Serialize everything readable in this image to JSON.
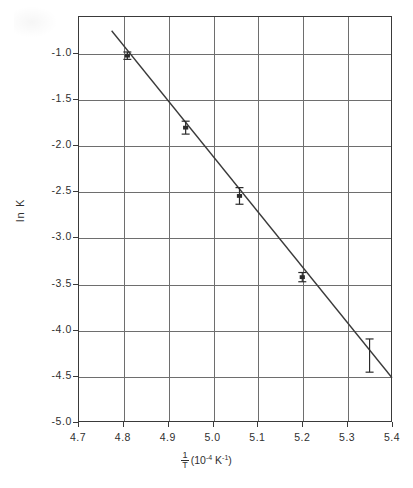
{
  "chart_data": {
    "type": "scatter",
    "title": "",
    "subtitle": "",
    "xlabel_parts": {
      "numerator": "1",
      "denominator": "T",
      "units": "(10",
      "units_exp": "-4",
      "units_mid": " K",
      "units_exp2": "-1",
      "units_close": ")"
    },
    "xlabel": "1/T (10^-4 K^-1)",
    "ylabel": "ln K",
    "xlim": [
      4.7,
      5.4
    ],
    "ylim": [
      -5.0,
      -0.6
    ],
    "grid": true,
    "legend": "none",
    "x_ticks": [
      "4.7",
      "4.8",
      "4.9",
      "5.0",
      "5.1",
      "5.2",
      "5.3",
      "5.4"
    ],
    "x_tick_values": [
      4.7,
      4.8,
      4.9,
      5.0,
      5.1,
      5.2,
      5.3,
      5.4
    ],
    "y_ticks": [
      "-1.0",
      "-1.5",
      "-2.0",
      "-2.5",
      "-3.0",
      "-3.5",
      "-4.0",
      "-4.5",
      "-5.0"
    ],
    "y_tick_values": [
      -1.0,
      -1.5,
      -2.0,
      -2.5,
      -3.0,
      -3.5,
      -4.0,
      -4.5,
      -5.0
    ],
    "x": [
      4.81,
      4.94,
      5.06,
      5.2,
      5.35
    ],
    "values": [
      -1.03,
      -1.81,
      -2.55,
      -3.43,
      -4.28
    ],
    "y_err": [
      0.04,
      0.07,
      0.09,
      0.05,
      0.18
    ],
    "series": [
      {
        "name": "ln K data",
        "x": [
          4.81,
          4.94,
          5.06,
          5.2,
          5.35
        ],
        "values": [
          -1.03,
          -1.81,
          -2.55,
          -3.43,
          -4.28
        ],
        "y_err": [
          0.04,
          0.07,
          0.09,
          0.05,
          0.18
        ]
      }
    ],
    "fit_line": {
      "name": "least-squares fit",
      "x_start": 4.775,
      "y_start": -0.76,
      "x_end": 5.4,
      "y_end": -4.52,
      "slope": -6.02,
      "intercept": 28.01
    },
    "colors": {
      "line": "#3a3a3a",
      "grid": "#6e6e6e",
      "frame": "#3a3a3a",
      "text": "#2f2f2f",
      "marker": "#2b2b2b"
    }
  }
}
